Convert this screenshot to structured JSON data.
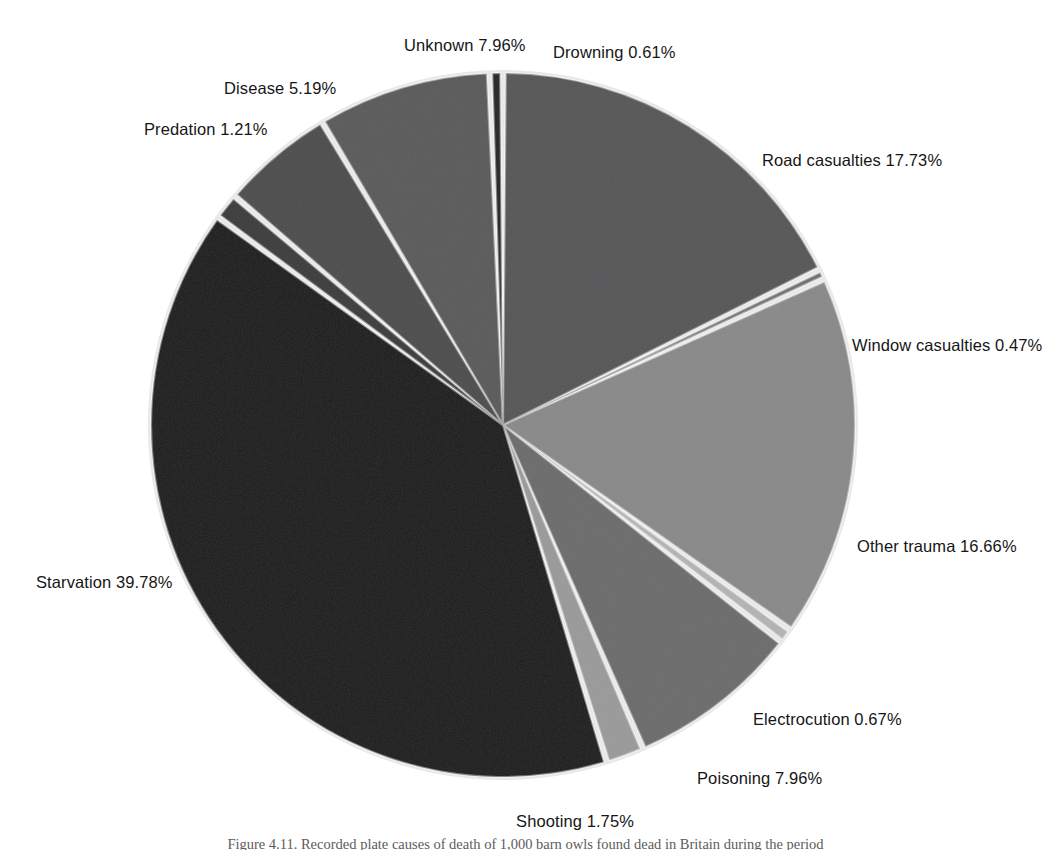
{
  "figure": {
    "background_color": "#ffffff",
    "caption": "Figure 4.11. Recorded plate causes of death of 1,000 barn owls found dead in Britain during the period"
  },
  "chart_data": {
    "type": "pie",
    "title": "",
    "xlabel": "",
    "ylabel": "",
    "legend_position": "none",
    "grid": false,
    "units": "percent",
    "total": 100.0,
    "start_angle_deg": 90,
    "direction": "clockwise",
    "center": {
      "x": 503,
      "y": 425
    },
    "radius": 352,
    "slice_gap_deg": 0.9,
    "categories": [
      "Road casualties",
      "Window casualties",
      "Other trauma",
      "Electrocution",
      "Poisoning",
      "Shooting",
      "Starvation",
      "Predation",
      "Disease",
      "Unknown",
      "Drowning"
    ],
    "values": [
      17.73,
      0.47,
      16.66,
      0.67,
      7.96,
      1.75,
      39.78,
      1.21,
      5.19,
      7.96,
      0.61
    ],
    "colors": [
      "#58585a",
      "#6f6f6f",
      "#8a8a8a",
      "#b4b4b4",
      "#6d6d6d",
      "#9b9b9b",
      "#1a1a1a",
      "#3c3c3c",
      "#4e4e4e",
      "#5b5b5b",
      "#242424"
    ],
    "slices": [
      {
        "label": "Road casualties 17.73%",
        "name": "Road casualties",
        "value": 17.73,
        "color": "#58585a",
        "label_x": 762,
        "label_y": 151,
        "anchor": "start"
      },
      {
        "label": "Window casualties 0.47%",
        "name": "Window casualties",
        "value": 0.47,
        "color": "#6f6f6f",
        "label_x": 852,
        "label_y": 336,
        "anchor": "start"
      },
      {
        "label": "Other trauma 16.66%",
        "name": "Other trauma",
        "value": 16.66,
        "color": "#8a8a8a",
        "label_x": 857,
        "label_y": 537,
        "anchor": "start"
      },
      {
        "label": "Electrocution 0.67%",
        "name": "Electrocution",
        "value": 0.67,
        "color": "#b4b4b4",
        "label_x": 753,
        "label_y": 710,
        "anchor": "start"
      },
      {
        "label": "Poisoning 7.96%",
        "name": "Poisoning",
        "value": 7.96,
        "color": "#6d6d6d",
        "label_x": 697,
        "label_y": 769,
        "anchor": "start"
      },
      {
        "label": "Shooting 1.75%",
        "name": "Shooting",
        "value": 1.75,
        "color": "#9b9b9b",
        "label_x": 575,
        "label_y": 812,
        "anchor": "middle"
      },
      {
        "label": "Starvation 39.78%",
        "name": "Starvation",
        "value": 39.78,
        "color": "#1a1a1a",
        "label_x": 36,
        "label_y": 573,
        "anchor": "start"
      },
      {
        "label": "Predation 1.21%",
        "name": "Predation",
        "value": 1.21,
        "color": "#3c3c3c",
        "label_x": 144,
        "label_y": 120,
        "anchor": "start"
      },
      {
        "label": "Disease 5.19%",
        "name": "Disease",
        "value": 5.19,
        "color": "#4e4e4e",
        "label_x": 224,
        "label_y": 79,
        "anchor": "start"
      },
      {
        "label": "Unknown 7.96%",
        "name": "Unknown",
        "value": 7.96,
        "color": "#5b5b5b",
        "label_x": 404,
        "label_y": 36,
        "anchor": "start"
      },
      {
        "label": "Drowning 0.61%",
        "name": "Drowning",
        "value": 0.61,
        "color": "#242424",
        "label_x": 553,
        "label_y": 43,
        "anchor": "start"
      }
    ]
  }
}
